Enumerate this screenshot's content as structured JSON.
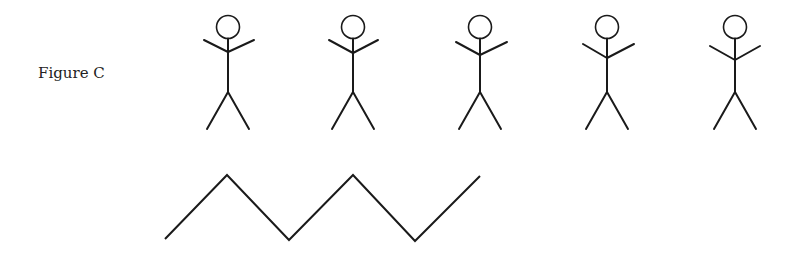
{
  "figure": {
    "label": "Figure C",
    "stroke_color": "#1a1a1a"
  },
  "stick_figures": [
    {
      "cx": 228,
      "arm_left": [
        204,
        40
      ],
      "arm_right": [
        254,
        40
      ],
      "shoulder_y": 52
    },
    {
      "cx": 353,
      "arm_left": [
        329,
        40
      ],
      "arm_right": [
        378,
        40
      ],
      "shoulder_y": 53
    },
    {
      "cx": 480,
      "arm_left": [
        456,
        42
      ],
      "arm_right": [
        507,
        42
      ],
      "shoulder_y": 55
    },
    {
      "cx": 607,
      "arm_left": [
        583,
        44
      ],
      "arm_right": [
        634,
        44
      ],
      "shoulder_y": 58
    },
    {
      "cx": 735,
      "arm_left": [
        710,
        46
      ],
      "arm_right": [
        760,
        46
      ],
      "shoulder_y": 60
    }
  ],
  "zigzag": {
    "points": [
      [
        165,
        239
      ],
      [
        227,
        175
      ],
      [
        289,
        240
      ],
      [
        353,
        175
      ],
      [
        415,
        241
      ],
      [
        480,
        176
      ]
    ]
  }
}
